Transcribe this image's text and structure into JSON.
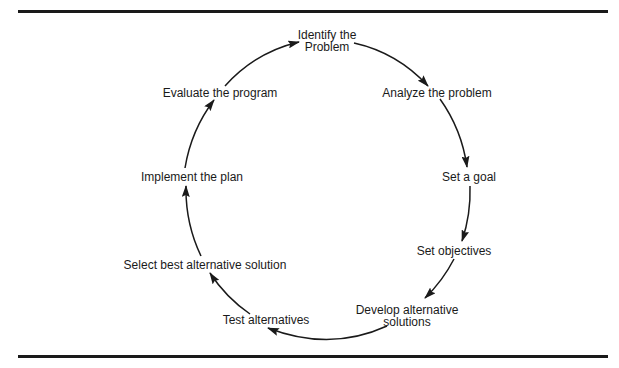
{
  "diagram": {
    "type": "cycle",
    "steps": [
      {
        "id": "identify",
        "line1": "Identify the",
        "line2": "Problem",
        "x": 327,
        "y": 41
      },
      {
        "id": "analyze",
        "line1": "Analyze the problem",
        "x": 437,
        "y": 93
      },
      {
        "id": "goal",
        "line1": "Set a goal",
        "x": 469,
        "y": 177
      },
      {
        "id": "objectives",
        "line1": "Set objectives",
        "x": 454,
        "y": 251
      },
      {
        "id": "develop",
        "line1": "Develop alternative",
        "line2": "solutions",
        "x": 407,
        "y": 316
      },
      {
        "id": "test",
        "line1": "Test alternatives",
        "x": 266,
        "y": 320
      },
      {
        "id": "select",
        "line1": "Select best alternative solution",
        "x": 205,
        "y": 265
      },
      {
        "id": "implement",
        "line1": "Implement the plan",
        "x": 192,
        "y": 177
      },
      {
        "id": "evaluate",
        "line1": "Evaluate the program",
        "x": 220,
        "y": 93
      }
    ],
    "edges": [
      {
        "from": "evaluate",
        "to": "identify"
      },
      {
        "from": "identify",
        "to": "analyze"
      },
      {
        "from": "analyze",
        "to": "goal"
      },
      {
        "from": "goal",
        "to": "objectives"
      },
      {
        "from": "objectives",
        "to": "develop"
      },
      {
        "from": "develop",
        "to": "test"
      },
      {
        "from": "test",
        "to": "select"
      },
      {
        "from": "select",
        "to": "implement"
      },
      {
        "from": "implement",
        "to": "evaluate"
      }
    ],
    "line_color": "#1a1a1a"
  }
}
